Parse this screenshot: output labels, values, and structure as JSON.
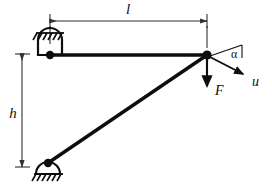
{
  "figure": {
    "type": "structural-mechanics-diagram",
    "background_color": "#ffffff",
    "line_color": "#0d0d0d",
    "dimension_color": "#303030",
    "width": 272,
    "height": 189
  },
  "labels": {
    "span_length": "l",
    "height": "h",
    "force": "F",
    "displacement": "u",
    "angle": "α"
  },
  "dimensions": {
    "horizontal": {
      "name": "l",
      "label": "l",
      "orientation": "horizontal",
      "x_start": 50,
      "x_end": 207,
      "y": 21,
      "label_x": 128,
      "label_y": 13
    },
    "vertical": {
      "name": "h",
      "label": "h",
      "orientation": "vertical",
      "x": 22,
      "y_start": 54,
      "y_end": 167,
      "label_x": 13,
      "label_y": 114
    }
  },
  "nodes": [
    {
      "name": "top-left-pin-support",
      "kind": "pin-support",
      "x": 50,
      "y": 55,
      "ground": "above",
      "hatch_count": 6
    },
    {
      "name": "bottom-left-pin-support",
      "kind": "pin-support",
      "x": 48,
      "y": 163,
      "ground": "below",
      "hatch_count": 6
    },
    {
      "name": "free-joint",
      "kind": "joint",
      "x": 207,
      "y": 55
    }
  ],
  "members": [
    {
      "name": "horizontal-member",
      "from": "top-left-pin-support",
      "to": "free-joint",
      "x1": 50,
      "y1": 55,
      "x2": 207,
      "y2": 55,
      "thickness": 3.4
    },
    {
      "name": "diagonal-member",
      "from": "bottom-left-pin-support",
      "to": "free-joint",
      "x1": 48,
      "y1": 163,
      "x2": 207,
      "y2": 55,
      "thickness": 3.4
    }
  ],
  "vectors": [
    {
      "name": "force-F",
      "label": "F",
      "direction": "down",
      "origin_x": 207,
      "origin_y": 55,
      "tip_x": 207,
      "tip_y": 88,
      "label_x": 215,
      "label_y": 93
    },
    {
      "name": "displacement-u",
      "label": "u",
      "direction": "down-right",
      "origin_x": 209,
      "origin_y": 56,
      "tip_x": 246,
      "tip_y": 75,
      "label_x": 254,
      "label_y": 84,
      "angle_degrees": 21
    }
  ],
  "angle_marker": {
    "name": "alpha-angle",
    "label": "α",
    "between": [
      "horizontal-reference",
      "displacement-u"
    ],
    "vertex_x": 209,
    "vertex_y": 56,
    "reference_end_x": 240,
    "reference_end_y": 47,
    "label_x": 229,
    "label_y": 57
  }
}
